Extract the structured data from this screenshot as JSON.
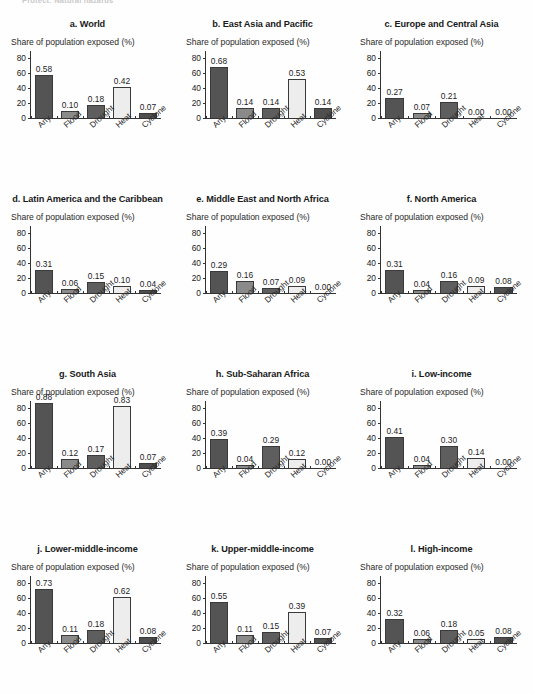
{
  "running_head": "Protect: Natural hazards",
  "common": {
    "axis_label": "Share of population exposed (%)",
    "categories": [
      "Any",
      "Flood",
      "Drought",
      "Heat",
      "Cyclone"
    ],
    "yticks": [
      "0",
      "20",
      "40",
      "60",
      "80"
    ],
    "ylim": [
      0,
      90
    ],
    "colors": {
      "Any": "#545454",
      "Flood": "#8a8a8a",
      "Drought": "#5e5e5e",
      "Heat": "#ededed",
      "Cyclone": "#4f4f4f",
      "axis": "#333333",
      "text": "#1a1a1a"
    }
  },
  "chart_data": [
    {
      "type": "bar",
      "panel": "a",
      "title": "a. World",
      "ylabel": "Share of population exposed (%)",
      "xlabel": "",
      "ylim": [
        0,
        90
      ],
      "yticks": [
        0,
        20,
        40,
        60,
        80
      ],
      "grid": false,
      "legend": "none",
      "categories": [
        "Any",
        "Flood",
        "Drought",
        "Heat",
        "Cyclone"
      ],
      "values": [
        58,
        10,
        18,
        42,
        7
      ],
      "labels": [
        "0.58",
        "0.10",
        "0.18",
        "0.42",
        "0.07"
      ]
    },
    {
      "type": "bar",
      "panel": "b",
      "title": "b. East Asia and Pacific",
      "ylabel": "Share of population exposed (%)",
      "xlabel": "",
      "ylim": [
        0,
        90
      ],
      "yticks": [
        0,
        20,
        40,
        60,
        80
      ],
      "grid": false,
      "legend": "none",
      "categories": [
        "Any",
        "Flood",
        "Drought",
        "Heat",
        "Cyclone"
      ],
      "values": [
        68,
        14,
        14,
        53,
        14
      ],
      "labels": [
        "0.68",
        "0.14",
        "0.14",
        "0.53",
        "0.14"
      ]
    },
    {
      "type": "bar",
      "panel": "c",
      "title": "c. Europe and Central Asia",
      "ylabel": "Share of population exposed (%)",
      "xlabel": "",
      "ylim": [
        0,
        90
      ],
      "yticks": [
        0,
        20,
        40,
        60,
        80
      ],
      "grid": false,
      "legend": "none",
      "categories": [
        "Any",
        "Flood",
        "Drought",
        "Heat",
        "Cyclone"
      ],
      "values": [
        27,
        7,
        21,
        0,
        0
      ],
      "labels": [
        "0.27",
        "0.07",
        "0.21",
        "0.00",
        "0.00"
      ]
    },
    {
      "type": "bar",
      "panel": "d",
      "title": "d. Latin America and the Caribbean",
      "ylabel": "Share of population exposed (%)",
      "xlabel": "",
      "ylim": [
        0,
        90
      ],
      "yticks": [
        0,
        20,
        40,
        60,
        80
      ],
      "grid": false,
      "legend": "none",
      "categories": [
        "Any",
        "Flood",
        "Drought",
        "Heat",
        "Cyclone"
      ],
      "values": [
        31,
        6,
        15,
        10,
        4
      ],
      "labels": [
        "0.31",
        "0.06",
        "0.15",
        "0.10",
        "0.04"
      ]
    },
    {
      "type": "bar",
      "panel": "e",
      "title": "e. Middle East and North Africa",
      "ylabel": "Share of population exposed (%)",
      "xlabel": "",
      "ylim": [
        0,
        90
      ],
      "yticks": [
        0,
        20,
        40,
        60,
        80
      ],
      "grid": false,
      "legend": "none",
      "categories": [
        "Any",
        "Flood",
        "Drought",
        "Heat",
        "Cyclone"
      ],
      "values": [
        29,
        16,
        7,
        9,
        0
      ],
      "labels": [
        "0.29",
        "0.16",
        "0.07",
        "0.09",
        "0.00"
      ]
    },
    {
      "type": "bar",
      "panel": "f",
      "title": "f. North America",
      "ylabel": "Share of population exposed (%)",
      "xlabel": "",
      "ylim": [
        0,
        90
      ],
      "yticks": [
        0,
        20,
        40,
        60,
        80
      ],
      "grid": false,
      "legend": "none",
      "categories": [
        "Any",
        "Flood",
        "Drought",
        "Heat",
        "Cyclone"
      ],
      "values": [
        31,
        4,
        16,
        9,
        8
      ],
      "labels": [
        "0.31",
        "0.04",
        "0.16",
        "0.09",
        "0.08"
      ]
    },
    {
      "type": "bar",
      "panel": "g",
      "title": "g. South Asia",
      "ylabel": "Share of population exposed (%)",
      "xlabel": "",
      "ylim": [
        0,
        90
      ],
      "yticks": [
        0,
        20,
        40,
        60,
        80
      ],
      "grid": false,
      "legend": "none",
      "categories": [
        "Any",
        "Flood",
        "Drought",
        "Heat",
        "Cyclone"
      ],
      "values": [
        88,
        12,
        17,
        83,
        7
      ],
      "labels": [
        "0.88",
        "0.12",
        "0.17",
        "0.83",
        "0.07"
      ]
    },
    {
      "type": "bar",
      "panel": "h",
      "title": "h. Sub-Saharan Africa",
      "ylabel": "Share of population exposed (%)",
      "xlabel": "",
      "ylim": [
        0,
        90
      ],
      "yticks": [
        0,
        20,
        40,
        60,
        80
      ],
      "grid": false,
      "legend": "none",
      "categories": [
        "Any",
        "Flood",
        "Drought",
        "Heat",
        "Cyclone"
      ],
      "values": [
        39,
        4,
        29,
        12,
        0
      ],
      "labels": [
        "0.39",
        "0.04",
        "0.29",
        "0.12",
        "0.00"
      ]
    },
    {
      "type": "bar",
      "panel": "i",
      "title": "i. Low-income",
      "ylabel": "Share of population exposed (%)",
      "xlabel": "",
      "ylim": [
        0,
        90
      ],
      "yticks": [
        0,
        20,
        40,
        60,
        80
      ],
      "grid": false,
      "legend": "none",
      "categories": [
        "Any",
        "Flood",
        "Drought",
        "Heat",
        "Cyclone"
      ],
      "values": [
        41,
        4,
        30,
        14,
        0
      ],
      "labels": [
        "0.41",
        "0.04",
        "0.30",
        "0.14",
        "0.00"
      ]
    },
    {
      "type": "bar",
      "panel": "j",
      "title": "j. Lower-middle-income",
      "ylabel": "Share of population exposed (%)",
      "xlabel": "",
      "ylim": [
        0,
        90
      ],
      "yticks": [
        0,
        20,
        40,
        60,
        80
      ],
      "grid": false,
      "legend": "none",
      "categories": [
        "Any",
        "Flood",
        "Drought",
        "Heat",
        "Cyclone"
      ],
      "values": [
        73,
        11,
        18,
        62,
        8
      ],
      "labels": [
        "0.73",
        "0.11",
        "0.18",
        "0.62",
        "0.08"
      ]
    },
    {
      "type": "bar",
      "panel": "k",
      "title": "k. Upper-middle-income",
      "ylabel": "Share of population exposed (%)",
      "xlabel": "",
      "ylim": [
        0,
        90
      ],
      "yticks": [
        0,
        20,
        40,
        60,
        80
      ],
      "grid": false,
      "legend": "none",
      "categories": [
        "Any",
        "Flood",
        "Drought",
        "Heat",
        "Cyclone"
      ],
      "values": [
        55,
        11,
        15,
        42,
        7
      ],
      "labels": [
        "0.55",
        "0.11",
        "0.15",
        "0.39",
        "0.07"
      ]
    },
    {
      "type": "bar",
      "panel": "l",
      "title": "l. High-income",
      "ylabel": "Share of population exposed (%)",
      "xlabel": "",
      "ylim": [
        0,
        90
      ],
      "yticks": [
        0,
        20,
        40,
        60,
        80
      ],
      "grid": false,
      "legend": "none",
      "categories": [
        "Any",
        "Flood",
        "Drought",
        "Heat",
        "Cyclone"
      ],
      "values": [
        32,
        6,
        18,
        5,
        8
      ],
      "labels": [
        "0.32",
        "0.06",
        "0.18",
        "0.05",
        "0.08"
      ]
    }
  ]
}
